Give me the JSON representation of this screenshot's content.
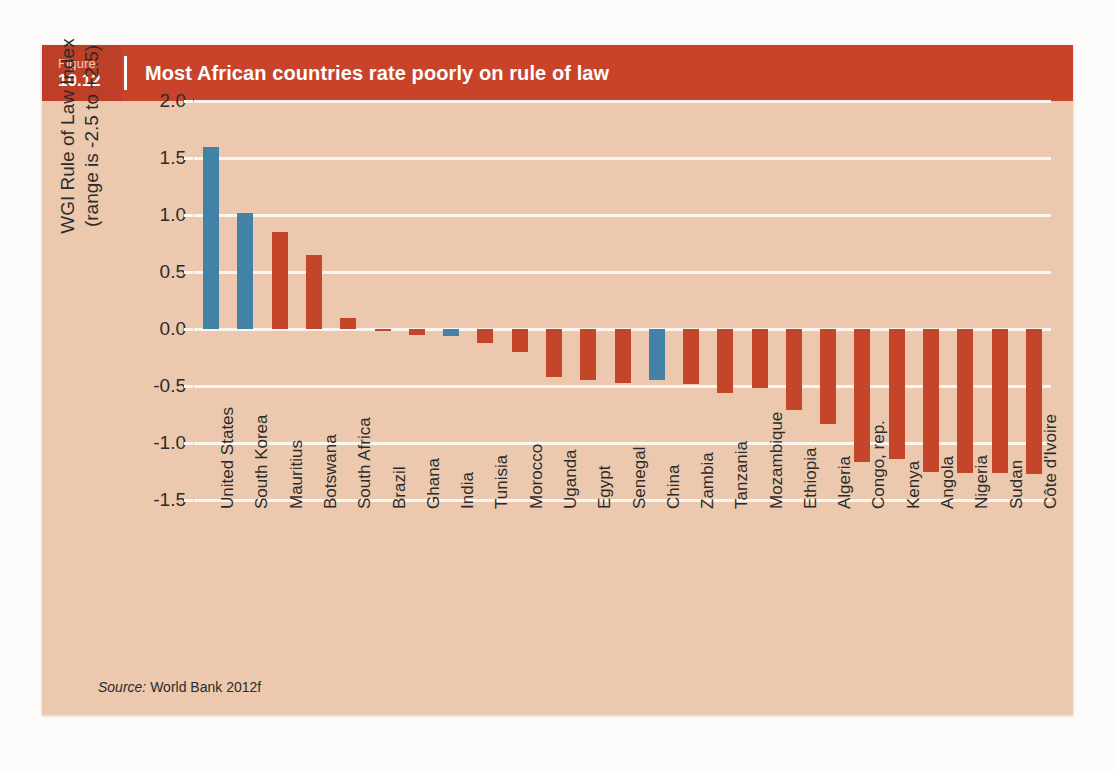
{
  "figure": {
    "figure_word": "Figure",
    "figure_number": "10.12",
    "title": "Most African countries rate poorly on rule of law",
    "source_label": "Source:",
    "source_text": "World Bank 2012f"
  },
  "colors": {
    "header_bg": "#c8432a",
    "number_block_bg": "#bd3f27",
    "card_bg": "#ecc9ae",
    "gridline": "#fdf6ef",
    "bar_red": "#c4452a",
    "bar_blue": "#4182a6",
    "text": "#2b2b2b"
  },
  "chart_data": {
    "type": "bar",
    "title": "Most African countries rate poorly on rule of law",
    "xlabel": "",
    "ylabel": "WGI Rule of Law Index (range is -2.5 to +2.5)",
    "ylabel_line1": "WGI Rule of Law Index",
    "ylabel_line2": "(range is -2.5 to +2.5)",
    "ylim": [
      -1.5,
      2.0
    ],
    "yticks": [
      "2.0",
      "1.5",
      "1.0",
      "0.5",
      "0.0",
      "-0.5",
      "-1.0",
      "-1.5"
    ],
    "ytick_values": [
      2.0,
      1.5,
      1.0,
      0.5,
      0.0,
      -0.5,
      -1.0,
      -1.5
    ],
    "grid": true,
    "legend": "none",
    "categories": [
      "United States",
      "South Korea",
      "Mauritius",
      "Botswana",
      "South Africa",
      "Brazil",
      "Ghana",
      "India",
      "Tunisia",
      "Morocco",
      "Uganda",
      "Egypt",
      "Senegal",
      "China",
      "Zambia",
      "Tanzania",
      "Mozambique",
      "Ethiopia",
      "Algeria",
      "Congo, rep.",
      "Kenya",
      "Angola",
      "Nigeria",
      "Sudan",
      "Côte d'Ivoire"
    ],
    "values": [
      1.6,
      1.02,
      0.85,
      0.65,
      0.1,
      -0.01,
      -0.05,
      -0.06,
      -0.12,
      -0.2,
      -0.42,
      -0.45,
      -0.47,
      -0.45,
      -0.48,
      -0.56,
      -0.52,
      -0.71,
      -0.83,
      -1.17,
      -1.14,
      -1.25,
      -1.26,
      -1.26,
      -1.27
    ],
    "bar_colors": [
      "blue",
      "blue",
      "red",
      "red",
      "red",
      "red",
      "red",
      "blue",
      "red",
      "red",
      "red",
      "red",
      "red",
      "blue",
      "red",
      "red",
      "red",
      "red",
      "red",
      "red",
      "red",
      "red",
      "red",
      "red",
      "red"
    ]
  }
}
